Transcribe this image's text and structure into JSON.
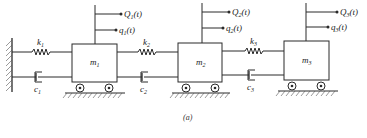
{
  "figure": {
    "caption": "(a)"
  },
  "masses": [
    {
      "symbol": "m",
      "index": "1",
      "force": {
        "symbol": "Q",
        "index": "1",
        "arg": "(t)"
      },
      "disp": {
        "symbol": "q",
        "index": "1",
        "arg": "(t)"
      }
    },
    {
      "symbol": "m",
      "index": "2",
      "force": {
        "symbol": "Q",
        "index": "2",
        "arg": "(t)"
      },
      "disp": {
        "symbol": "q",
        "index": "2",
        "arg": "(t)"
      }
    },
    {
      "symbol": "m",
      "index": "3",
      "force": {
        "symbol": "Q",
        "index": "3",
        "arg": "(t)"
      },
      "disp": {
        "symbol": "q",
        "index": "3",
        "arg": "(t)"
      }
    }
  ],
  "springs": [
    {
      "symbol": "k",
      "index": "1"
    },
    {
      "symbol": "k",
      "index": "2"
    },
    {
      "symbol": "k",
      "index": "3"
    }
  ],
  "dampers": [
    {
      "symbol": "c",
      "index": "1"
    },
    {
      "symbol": "c",
      "index": "2"
    },
    {
      "symbol": "c",
      "index": "3"
    }
  ],
  "colors": {
    "ink": "#2a2a2a",
    "background": "#ffffff"
  }
}
